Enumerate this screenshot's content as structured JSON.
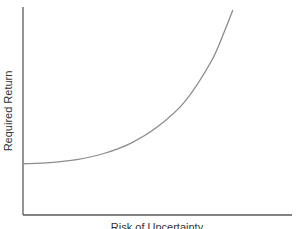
{
  "chart_data": {
    "type": "line",
    "title": "",
    "xlabel": "Risk of Uncertainty",
    "ylabel": "Required Return",
    "x_ticks": [],
    "y_ticks": [],
    "grid": false,
    "legend": null,
    "xlim": [
      0,
      1
    ],
    "ylim": [
      0,
      1
    ],
    "series": [
      {
        "name": "Required return vs risk",
        "color": "#8c8c8c",
        "x": [
          0.0,
          0.1,
          0.2,
          0.3,
          0.4,
          0.5,
          0.6,
          0.7,
          0.75,
          0.78
        ],
        "y": [
          0.25,
          0.255,
          0.27,
          0.3,
          0.35,
          0.43,
          0.55,
          0.75,
          0.9,
          1.0
        ]
      }
    ]
  },
  "labels": {
    "y_axis": "Required Return",
    "x_axis": "Risk of Uncertainty"
  },
  "colors": {
    "axis": "#5a5a5a",
    "curve": "#8c8c8c",
    "text": "#333333",
    "background": "#ffffff"
  }
}
